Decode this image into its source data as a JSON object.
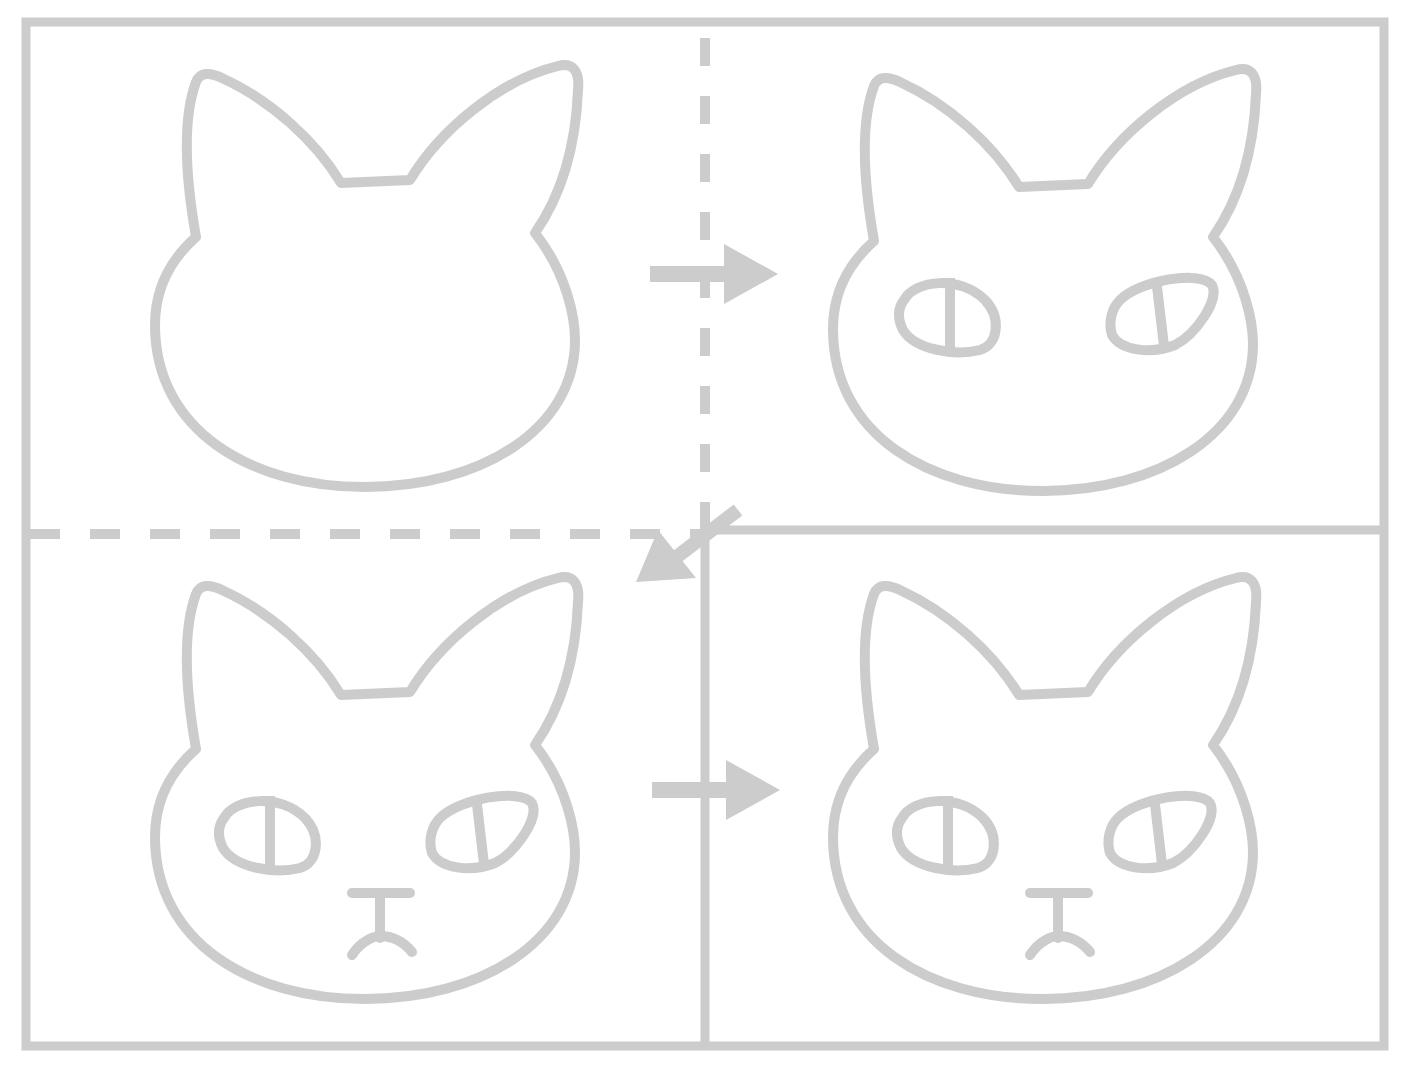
{
  "diagram": {
    "title": "",
    "stroke_color": "#cccccc",
    "background": "#ffffff",
    "steps": [
      {
        "index": 1,
        "position": "top-left",
        "features": [
          "head-outline",
          "ears"
        ]
      },
      {
        "index": 2,
        "position": "top-right",
        "features": [
          "head-outline",
          "ears",
          "eyes"
        ]
      },
      {
        "index": 3,
        "position": "bottom-left",
        "features": [
          "head-outline",
          "ears",
          "eyes",
          "nose",
          "mouth"
        ]
      },
      {
        "index": 4,
        "position": "bottom-right",
        "features": [
          "head-outline",
          "ears",
          "eyes",
          "nose",
          "mouth"
        ]
      }
    ],
    "arrows": [
      {
        "from": 1,
        "to": 2,
        "direction": "right"
      },
      {
        "from": 2,
        "to": 3,
        "direction": "down-left"
      },
      {
        "from": 3,
        "to": 4,
        "direction": "right"
      }
    ]
  }
}
